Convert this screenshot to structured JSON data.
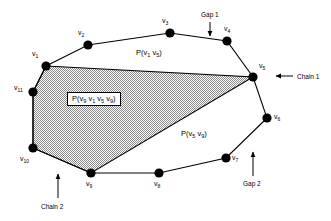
{
  "figure": {
    "background_color": "#ffffff",
    "stroke_color": "#000000",
    "vertex_color": "#000000",
    "shade_color": "#a9a9a9"
  },
  "vertices": [
    {
      "id": "v1",
      "label": "v",
      "sub": "1",
      "x": 46,
      "y": 66,
      "label_x": 32,
      "label_y": 50
    },
    {
      "id": "v2",
      "label": "v",
      "sub": "2",
      "x": 88,
      "y": 45,
      "label_x": 78,
      "label_y": 29
    },
    {
      "id": "v3",
      "label": "v",
      "sub": "3",
      "x": 170,
      "y": 33,
      "label_x": 162,
      "label_y": 17
    },
    {
      "id": "v4",
      "label": "v",
      "sub": "4",
      "x": 227,
      "y": 41,
      "label_x": 224,
      "label_y": 25
    },
    {
      "id": "v5",
      "label": "v",
      "sub": "5",
      "x": 253,
      "y": 77,
      "label_x": 259,
      "label_y": 62
    },
    {
      "id": "v6",
      "label": "v",
      "sub": "6",
      "x": 267,
      "y": 118,
      "label_x": 274,
      "label_y": 113
    },
    {
      "id": "v7",
      "label": "v",
      "sub": "7",
      "x": 226,
      "y": 158,
      "label_x": 232,
      "label_y": 154
    },
    {
      "id": "v8",
      "label": "v",
      "sub": "8",
      "x": 159,
      "y": 173,
      "label_x": 154,
      "label_y": 180
    },
    {
      "id": "v9",
      "label": "v",
      "sub": "9",
      "x": 91,
      "y": 173,
      "label_x": 86,
      "label_y": 180
    },
    {
      "id": "v10",
      "label": "v",
      "sub": "10",
      "x": 33,
      "y": 148,
      "label_x": 20,
      "label_y": 155
    },
    {
      "id": "v11",
      "label": "v",
      "sub": "11",
      "x": 33,
      "y": 92,
      "label_x": 14,
      "label_y": 84
    }
  ],
  "outer_polygon_order": [
    "v1",
    "v2",
    "v3",
    "v4",
    "v5",
    "v6",
    "v7",
    "v8",
    "v9",
    "v10",
    "v11"
  ],
  "shaded_polygon_order": [
    "v1",
    "v5",
    "v9",
    "v10",
    "v11"
  ],
  "labels": {
    "chain_upper": {
      "text": "P(v",
      "sub1": "1",
      "mid": " v",
      "sub2": "5",
      "close": ")",
      "full": "P(v1 v5)",
      "x": 136,
      "y": 49
    },
    "chain_lower": {
      "text": "P(v",
      "sub1": "5",
      "mid": " v",
      "sub2": "9",
      "close": ")",
      "full": "P(v5 v9)",
      "x": 181,
      "y": 130
    },
    "shaded_region": {
      "full": "P(v9 v1 v5 v9)",
      "p": "P(v",
      "s1": "9",
      "a": " v",
      "s2": "1",
      "b": " v",
      "s3": "5",
      "c": " v",
      "s4": "9",
      "close": ")",
      "x": 67,
      "y": 92
    }
  },
  "annotations": [
    {
      "id": "gap1",
      "text": "Gap 1",
      "x": 201,
      "y": 11,
      "arrow": "down",
      "arrow_x": 210,
      "arrow_y1": 22,
      "arrow_y2": 36
    },
    {
      "id": "chain1",
      "text": "Chain 1",
      "x": 297,
      "y": 73,
      "arrow": "left",
      "arrow_y": 76,
      "arrow_x1": 293,
      "arrow_x2": 276
    },
    {
      "id": "gap2",
      "text": "Gap 2",
      "x": 243,
      "y": 180,
      "arrow": "up",
      "arrow_x": 253,
      "arrow_y1": 176,
      "arrow_y2": 152
    },
    {
      "id": "chain2",
      "text": "Chain 2",
      "x": 41,
      "y": 203,
      "arrow": "up",
      "arrow_x": 58,
      "arrow_y1": 198,
      "arrow_y2": 174
    }
  ]
}
